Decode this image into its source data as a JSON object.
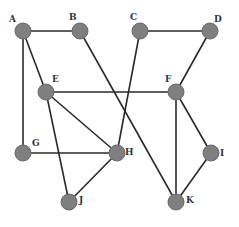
{
  "diagram": {
    "type": "undirected-graph",
    "colors": {
      "node": "#7f7f7f",
      "edge": "#2a2a2a",
      "label": "#333333",
      "background": "#ffffff"
    },
    "nodes": [
      {
        "id": "A",
        "label": "A",
        "x": 23,
        "y": 31,
        "lx": 9,
        "ly": 22
      },
      {
        "id": "B",
        "label": "B",
        "x": 80,
        "y": 31,
        "lx": 69,
        "ly": 20
      },
      {
        "id": "C",
        "label": "C",
        "x": 140,
        "y": 31,
        "lx": 130,
        "ly": 20
      },
      {
        "id": "D",
        "label": "D",
        "x": 210,
        "y": 31,
        "lx": 214,
        "ly": 22
      },
      {
        "id": "E",
        "label": "E",
        "x": 46,
        "y": 92,
        "lx": 52,
        "ly": 82
      },
      {
        "id": "F",
        "label": "F",
        "x": 176,
        "y": 92,
        "lx": 165,
        "ly": 82
      },
      {
        "id": "G",
        "label": "G",
        "x": 23,
        "y": 153,
        "lx": 32,
        "ly": 146
      },
      {
        "id": "H",
        "label": "H",
        "x": 117,
        "y": 153,
        "lx": 125,
        "ly": 155
      },
      {
        "id": "I",
        "label": "I",
        "x": 211,
        "y": 153,
        "lx": 220,
        "ly": 156
      },
      {
        "id": "J",
        "label": "J",
        "x": 69,
        "y": 202,
        "lx": 79,
        "ly": 203
      },
      {
        "id": "K",
        "label": "K",
        "x": 176,
        "y": 202,
        "lx": 186,
        "ly": 203
      }
    ],
    "edges": [
      [
        "A",
        "B"
      ],
      [
        "A",
        "E"
      ],
      [
        "A",
        "G"
      ],
      [
        "B",
        "K"
      ],
      [
        "C",
        "D"
      ],
      [
        "C",
        "H"
      ],
      [
        "D",
        "F"
      ],
      [
        "E",
        "F"
      ],
      [
        "E",
        "H"
      ],
      [
        "E",
        "J"
      ],
      [
        "G",
        "H"
      ],
      [
        "H",
        "J"
      ],
      [
        "F",
        "I"
      ],
      [
        "F",
        "K"
      ],
      [
        "I",
        "K"
      ]
    ]
  }
}
